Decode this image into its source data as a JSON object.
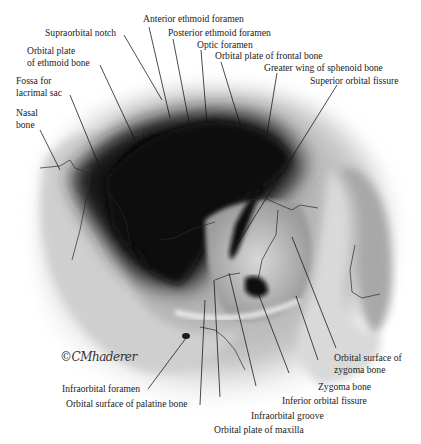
{
  "figure": {
    "signature": "©CMhaderer"
  },
  "labels": {
    "anterior_ethmoid_foramen": "Anterior ethmoid foramen",
    "supraorbital_notch": "Supraorbital notch",
    "posterior_ethmoid_foramen": "Posterior ethmoid foramen",
    "optic_foramen": "Optic foramen",
    "orbital_plate_ethmoid_1": "Orbital plate",
    "orbital_plate_ethmoid_2": "of ethmoid bone",
    "orbital_plate_frontal": "Orbital plate of frontal bone",
    "greater_wing_sphenoid": "Greater wing of sphenoid bone",
    "superior_orbital_fissure": "Superior orbital fissure",
    "fossa_lacrimal_1": "Fossa  for",
    "fossa_lacrimal_2": "lacrimal sac",
    "nasal_bone_1": "Nasal",
    "nasal_bone_2": "bone",
    "orbital_surface_zygoma_1": "Orbital surface of",
    "orbital_surface_zygoma_2": "zygoma bone",
    "zygoma_bone": "Zygoma bone",
    "inferior_orbital_fissure": "Inferior orbital fissure",
    "infraorbital_foramen": "Infraorbital foramen",
    "orbital_surface_palatine": "Orbital surface of palatine bone",
    "infraorbital_groove": "Infraorbital groove",
    "orbital_plate_maxilla": "Orbital plate of maxilla"
  }
}
